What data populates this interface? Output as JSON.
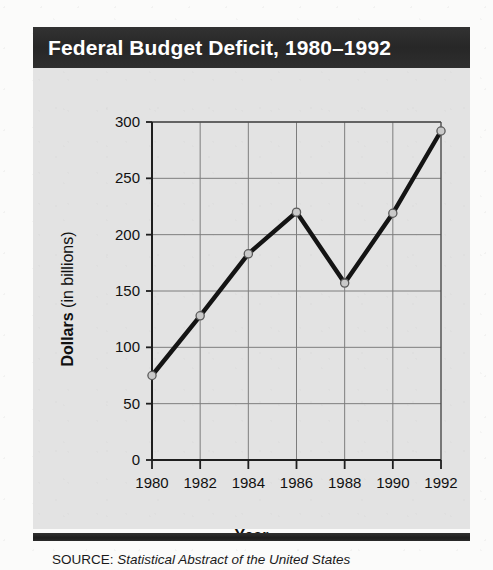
{
  "figure": {
    "title": "Federal Budget Deficit, 1980–1992",
    "source_label": "SOURCE:",
    "source_title": "Statistical Abstract of the United States",
    "y_axis_title_strong": "Dollars",
    "y_axis_title_rest": " (in billions)",
    "x_axis_title": "Year",
    "title_bar_color": "#2c2c2c",
    "body_color": "#e3e3e3",
    "line_color": "#141414",
    "marker_fill": "#c9c9c9",
    "gridline_color": "#7d7d7d"
  },
  "chart_data": {
    "type": "line",
    "title": "Federal Budget Deficit, 1980–1992",
    "xlabel": "Year",
    "ylabel": "Dollars (in billions)",
    "x": [
      1980,
      1982,
      1984,
      1986,
      1988,
      1990,
      1992
    ],
    "values": [
      75,
      128,
      183,
      220,
      157,
      219,
      292
    ],
    "xtick_labels": [
      "1980",
      "1982",
      "1984",
      "1986",
      "1988",
      "1990",
      "1992"
    ],
    "ytick_labels": [
      "0",
      "50",
      "100",
      "150",
      "200",
      "250",
      "300"
    ],
    "yticks": [
      0,
      50,
      100,
      150,
      200,
      250,
      300
    ],
    "xlim": [
      1980,
      1992
    ],
    "ylim": [
      0,
      300
    ],
    "grid": true,
    "legend": false,
    "markers": "open-circle",
    "series_name": "Federal budget deficit"
  }
}
